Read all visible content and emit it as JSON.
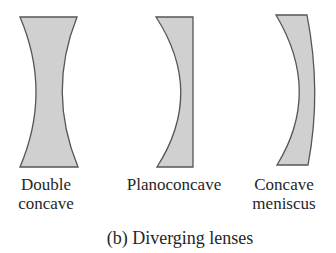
{
  "figure": {
    "caption": "(b) Diverging lenses",
    "fill_color": "#d0d0d0",
    "stroke_color": "#555555"
  },
  "lenses": [
    {
      "name": "double-concave",
      "label_line1": "Double",
      "label_line2": "concave"
    },
    {
      "name": "planoconcave",
      "label_line1": "Planoconcave",
      "label_line2": ""
    },
    {
      "name": "concave-meniscus",
      "label_line1": "Concave",
      "label_line2": "meniscus"
    }
  ]
}
